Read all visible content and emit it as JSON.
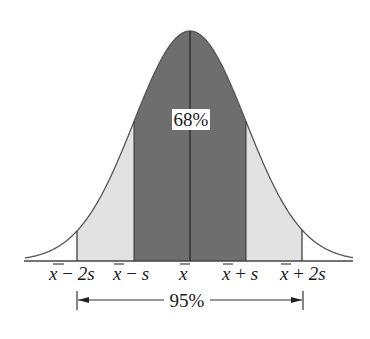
{
  "diagram": {
    "type": "normal-distribution",
    "colors": {
      "curve": "#555555",
      "center_band": "#6e6e6e",
      "outer_band": "#e2e2e2",
      "lines": "#333333",
      "label_box": "#ffffff",
      "text": "#1a1a1a"
    },
    "center_label": "68%",
    "range_label": "95%",
    "axis_labels": [
      {
        "mean": "x",
        "op": " − ",
        "term": "2s",
        "key": "minus-2s"
      },
      {
        "mean": "x",
        "op": " − ",
        "term": "s",
        "key": "minus-s"
      },
      {
        "mean": "x",
        "op": "",
        "term": "",
        "key": "mean"
      },
      {
        "mean": "x",
        "op": " + ",
        "term": "s",
        "key": "plus-s"
      },
      {
        "mean": "x",
        "op": " + ",
        "term": "2s",
        "key": "plus-2s"
      }
    ]
  }
}
